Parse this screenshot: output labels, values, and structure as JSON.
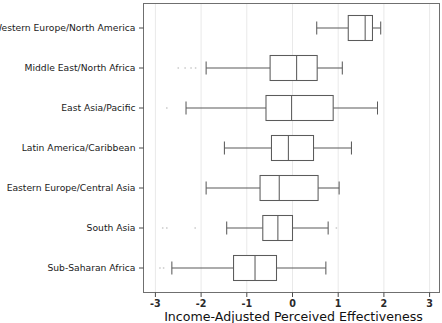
{
  "chart_data": {
    "type": "box",
    "title": "",
    "subtitle": "",
    "xlabel": "Income-Adjusted Perceived Effectiveness",
    "ylabel": "",
    "orientation": "horizontal",
    "xlim": [
      -3.35,
      3.25
    ],
    "xticks": [
      -3,
      -2,
      -1,
      0,
      1,
      2,
      3
    ],
    "xticklabels": [
      "-3",
      "-2",
      "-1",
      "0",
      "1",
      "2",
      "3"
    ],
    "grid": "vertical-light",
    "legend": "none",
    "categories": [
      "Western Europe/North America",
      "Middle East/North Africa",
      "East Asia/Pacific",
      "Latin America/Caribbean",
      "Eastern Europe/Central Asia",
      "South Asia",
      "Sub-Saharan Africa"
    ],
    "boxes": [
      {
        "category": "Western Europe/North America",
        "whisker_low": 0.53,
        "q1": 1.22,
        "median": 1.59,
        "q3": 1.75,
        "whisker_high": 1.93,
        "outliers": []
      },
      {
        "category": "Middle East/North Africa",
        "whisker_low": -1.89,
        "q1": -0.49,
        "median": 0.09,
        "q3": 0.54,
        "whisker_high": 1.09,
        "outliers": [
          -2.5,
          -2.35,
          -2.22,
          -2.12
        ]
      },
      {
        "category": "East Asia/Pacific",
        "whisker_low": -2.33,
        "q1": -0.58,
        "median": -0.02,
        "q3": 0.89,
        "whisker_high": 1.86,
        "outliers": [
          -2.75
        ]
      },
      {
        "category": "Latin America/Caribbean",
        "whisker_low": -1.49,
        "q1": -0.46,
        "median": -0.09,
        "q3": 0.46,
        "whisker_high": 1.29,
        "outliers": []
      },
      {
        "category": "Eastern Europe/Central Asia",
        "whisker_low": -1.89,
        "q1": -0.71,
        "median": -0.29,
        "q3": 0.56,
        "whisker_high": 1.02,
        "outliers": []
      },
      {
        "category": "South Asia",
        "whisker_low": -1.44,
        "q1": -0.65,
        "median": -0.32,
        "q3": 0.0,
        "whisker_high": 0.78,
        "outliers": [
          -2.84,
          -2.75,
          -2.13,
          0.96
        ]
      },
      {
        "category": "Sub-Saharan Africa",
        "whisker_low": -2.64,
        "q1": -1.29,
        "median": -0.82,
        "q3": -0.35,
        "whisker_high": 0.73,
        "outliers": [
          -2.9,
          -2.82
        ]
      }
    ]
  },
  "style": {
    "frame_color": "#6f6f6f",
    "box_color": "#5b5b5b",
    "grid_color": "#e9e9e9",
    "outlier_color": "#d2d2d2",
    "background": "#ffffff"
  }
}
